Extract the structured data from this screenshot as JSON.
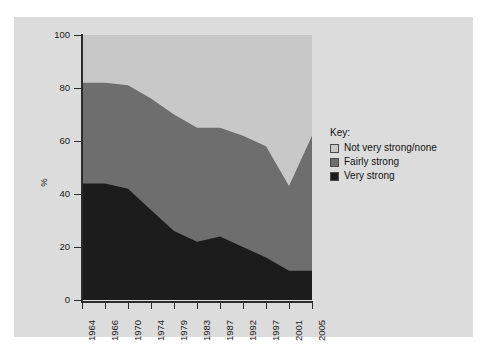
{
  "chart_data": {
    "type": "area",
    "stacked": true,
    "title": "",
    "xlabel": "",
    "ylabel": "%",
    "ylim": [
      0,
      100
    ],
    "yticks": [
      0,
      20,
      40,
      60,
      80,
      100
    ],
    "grid": false,
    "legend_position": "right",
    "legend_title": "Key:",
    "categories": [
      "1964",
      "1966",
      "1970",
      "1974",
      "1979",
      "1983",
      "1987",
      "1992",
      "1997",
      "2001",
      "2005"
    ],
    "series": [
      {
        "name": "Very strong",
        "color": "#1c1c1c",
        "values": [
          44,
          44,
          42,
          34,
          26,
          22,
          24,
          20,
          16,
          11,
          11
        ]
      },
      {
        "name": "Fairly strong",
        "color": "#6e6e6e",
        "values": [
          38,
          38,
          39,
          42,
          44,
          43,
          41,
          42,
          42,
          32,
          51
        ]
      },
      {
        "name": "Not very strong/none",
        "color": "#c8c8c8",
        "values": [
          18,
          18,
          19,
          24,
          30,
          35,
          35,
          38,
          42,
          57,
          38
        ]
      }
    ],
    "cumulative_tops": {
      "very_strong": [
        44,
        44,
        42,
        34,
        26,
        22,
        24,
        20,
        16,
        11,
        11
      ],
      "fairly_strong": [
        82,
        82,
        81,
        76,
        70,
        65,
        65,
        62,
        58,
        43,
        62
      ],
      "none": [
        100,
        100,
        100,
        100,
        100,
        100,
        100,
        100,
        100,
        100,
        100
      ]
    }
  },
  "legend": {
    "title": "Key:",
    "items": [
      {
        "label": "Not very strong/none",
        "color": "#c8c8c8"
      },
      {
        "label": "Fairly strong",
        "color": "#6e6e6e"
      },
      {
        "label": "Very strong",
        "color": "#1c1c1c"
      }
    ]
  },
  "axes": {
    "y_label": "%",
    "y_ticks": [
      "0",
      "20",
      "40",
      "60",
      "80",
      "100"
    ],
    "x_ticks": [
      "1964",
      "1966",
      "1970",
      "1974",
      "1979",
      "1983",
      "1987",
      "1992",
      "1997",
      "2001",
      "2005"
    ]
  },
  "colors": {
    "panel_background": "#dcdcdc",
    "page_background": "#ffffff",
    "axis": "#2b2b2b",
    "text": "#1a1a1a"
  }
}
